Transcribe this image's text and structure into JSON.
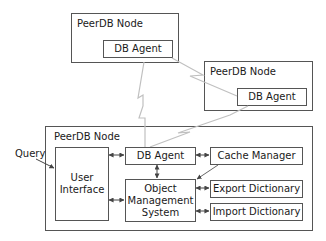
{
  "diagram": {
    "nodes": [
      {
        "id": "peer-node-1",
        "label": "PeerDB Node",
        "agent_label": "DB Agent"
      },
      {
        "id": "peer-node-2",
        "label": "PeerDB Node",
        "agent_label": "DB Agent"
      },
      {
        "id": "local-node",
        "label": "PeerDB Node"
      }
    ],
    "components": {
      "user_interface": "User Interface",
      "db_agent": "DB Agent",
      "cache_manager": "Cache Manager",
      "object_management_system": "Object Management System",
      "export_dictionary": "Export Dictionary",
      "import_dictionary": "Import Dictionary"
    },
    "external_input": "Query",
    "edges": [
      {
        "from": "Query",
        "to": "User Interface",
        "type": "arrow"
      },
      {
        "from": "User Interface",
        "to": "DB Agent",
        "type": "bidirectional"
      },
      {
        "from": "User Interface",
        "to": "Object Management System",
        "type": "bidirectional"
      },
      {
        "from": "DB Agent",
        "to": "Object Management System",
        "type": "bidirectional"
      },
      {
        "from": "DB Agent",
        "to": "Cache Manager",
        "type": "bidirectional"
      },
      {
        "from": "Cache Manager",
        "to": "Object Management System",
        "type": "arrow"
      },
      {
        "from": "Object Management System",
        "to": "Export Dictionary",
        "type": "bidirectional"
      },
      {
        "from": "Object Management System",
        "to": "Import Dictionary",
        "type": "bidirectional"
      },
      {
        "from": "DB Agent",
        "to": "PeerDB Node 1 DB Agent",
        "type": "network-link"
      },
      {
        "from": "DB Agent",
        "to": "PeerDB Node 2 DB Agent",
        "type": "network-link"
      },
      {
        "from": "PeerDB Node 1 DB Agent",
        "to": "PeerDB Node 2 DB Agent",
        "type": "network-link"
      }
    ],
    "colors": {
      "line": "#555555",
      "network_link": "#bbbbbb",
      "background": "#ffffff"
    }
  }
}
